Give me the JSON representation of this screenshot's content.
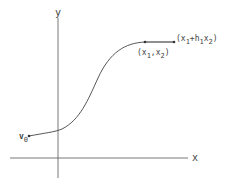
{
  "diagram": {
    "axes": {
      "x_label": "x",
      "y_label": "y"
    },
    "points": {
      "start": {
        "label_main": "v",
        "label_sub": "0"
      },
      "point_a": {
        "label_parts": [
          {
            "t": "(x",
            "sub": false
          },
          {
            "t": "1",
            "sub": true
          },
          {
            "t": ",x",
            "sub": false
          },
          {
            "t": "2",
            "sub": true
          },
          {
            "t": ")",
            "sub": false
          }
        ]
      },
      "point_b": {
        "label_parts": [
          {
            "t": "(x",
            "sub": false
          },
          {
            "t": "1",
            "sub": true
          },
          {
            "t": "+h",
            "sub": false
          },
          {
            "t": "1",
            "sub": true
          },
          {
            "t": "x",
            "sub": false
          },
          {
            "t": "2",
            "sub": true
          },
          {
            "t": ")",
            "sub": false
          }
        ]
      }
    },
    "colors": {
      "stroke": "#444444",
      "text": "#444444"
    }
  }
}
